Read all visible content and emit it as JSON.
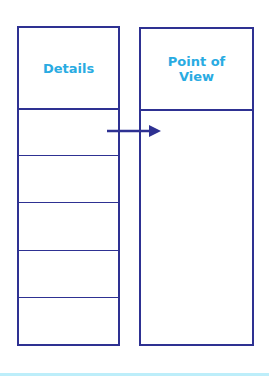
{
  "diagram": {
    "left_column": {
      "title": "Details",
      "rows": 5
    },
    "right_column": {
      "title_line1": "Point of",
      "title_line2": "View"
    },
    "arrow": {
      "from": "Details row 1",
      "to": "Point of View"
    },
    "colors": {
      "stroke": "#2e3192",
      "heading_text": "#29abe2",
      "bottom_bar": "#bdeefa"
    }
  }
}
